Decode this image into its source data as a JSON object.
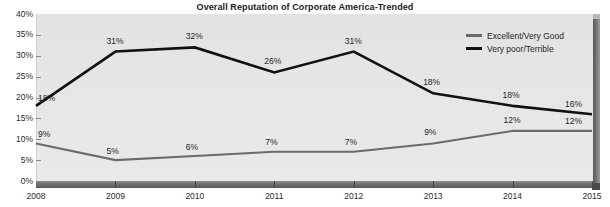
{
  "chart_data": {
    "type": "line",
    "title": "Overall Reputation of Corporate America-Trended",
    "xlabel": "",
    "ylabel": "",
    "ylim": [
      0,
      40
    ],
    "grid": false,
    "legend_position": "top-right",
    "categories": [
      "2008",
      "2009",
      "2010",
      "2011",
      "2012",
      "2013",
      "2014",
      "2015"
    ],
    "ytick_labels": [
      "40%",
      "35%",
      "30%",
      "25%",
      "20%",
      "15%",
      "10%",
      "5%",
      "0%"
    ],
    "ytick_values": [
      40,
      35,
      30,
      25,
      20,
      15,
      10,
      5,
      0
    ],
    "series": [
      {
        "name": "Excellent/Very Good",
        "color": "#6b6b6b",
        "values": [
          9,
          5,
          6,
          7,
          7,
          9,
          12,
          12
        ],
        "labels": [
          "9%",
          "5%",
          "6%",
          "7%",
          "7%",
          "9%",
          "12%",
          "12%"
        ]
      },
      {
        "name": "Very poor/Terrible",
        "color": "#111111",
        "values": [
          18,
          31,
          32,
          26,
          31,
          21,
          18,
          16
        ],
        "labels": [
          "18%",
          "31%",
          "32%",
          "26%",
          "31%",
          "18%",
          "18%",
          "16%"
        ]
      }
    ]
  },
  "legend": {
    "items": [
      {
        "label": "Excellent/Very Good",
        "color": "#6b6b6b"
      },
      {
        "label": "Very poor/Terrible",
        "color": "#111111"
      }
    ]
  }
}
